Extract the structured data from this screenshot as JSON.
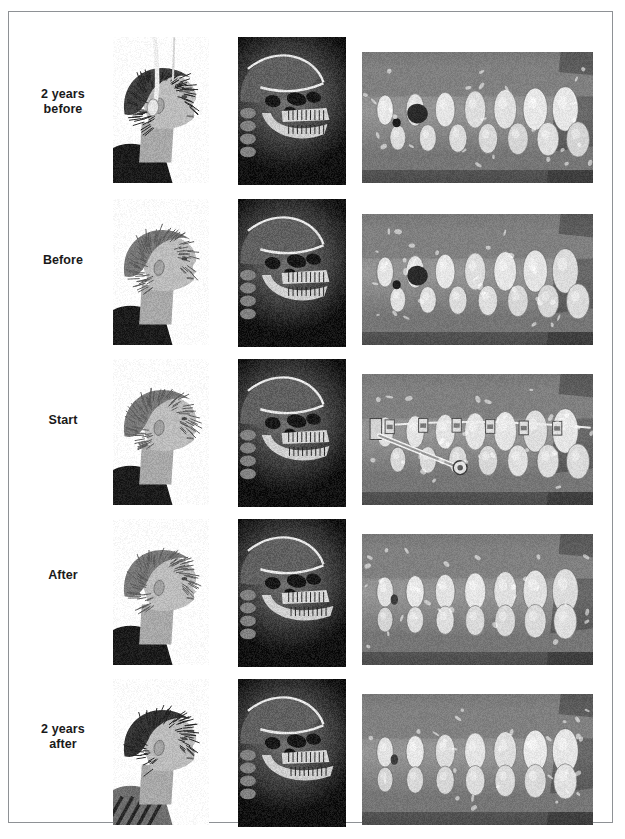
{
  "figure": {
    "caption": "",
    "frame_color": "#8e9195",
    "background_color": "#ffffff",
    "label_color": "#1a1a1a",
    "columns": [
      {
        "key": "profile",
        "name": "facial-profile-photograph",
        "label": ""
      },
      {
        "key": "ceph",
        "name": "lateral-cephalogram-radiograph",
        "label": ""
      },
      {
        "key": "intraoral",
        "name": "intraoral-lateral-photograph",
        "label": ""
      }
    ],
    "rows": [
      {
        "id": "two-years-before",
        "label": "2 years\nbefore",
        "label_line1": "2 years",
        "label_line2": "before",
        "profile_alt": "Boy in profile wearing headgear with head strap",
        "ceph_alt": "Lateral cephalometric radiograph showing retrusive mandible",
        "intraoral_alt": "Right lateral intraoral view, mixed dentition, Class II molar relation"
      },
      {
        "id": "before",
        "label": "Before",
        "label_line1": "Before",
        "label_line2": "",
        "profile_alt": "Boy in profile, convex facial profile, dark shirt",
        "ceph_alt": "Lateral cephalometric radiograph with increased overjet",
        "intraoral_alt": "Right lateral intraoral view showing large overjet"
      },
      {
        "id": "start",
        "label": "Start",
        "label_line1": "Start",
        "label_line2": "",
        "profile_alt": "Boy in profile at start of fixed appliance therapy",
        "ceph_alt": "Lateral cephalometric radiograph at start of treatment",
        "intraoral_alt": "Right lateral intraoral view with fixed braces and Herbst telescopic appliance"
      },
      {
        "id": "after",
        "label": "After",
        "label_line1": "After",
        "label_line2": "",
        "profile_alt": "Boy in profile after treatment, improved chin projection",
        "ceph_alt": "Lateral cephalometric radiograph after treatment",
        "intraoral_alt": "Right lateral intraoral view after appliance removal, corrected overjet"
      },
      {
        "id": "two-years-after",
        "label": "2 years\nafter",
        "label_line1": "2 years",
        "label_line2": "after",
        "profile_alt": "Older boy in profile with curly hair, striped collar",
        "ceph_alt": "Lateral cephalometric radiograph two years post treatment",
        "intraoral_alt": "Right lateral intraoral view two years post treatment, stable Class I occlusion"
      }
    ],
    "geometry": {
      "row_tops": [
        13,
        175,
        335,
        495,
        655
      ],
      "row_heights": [
        162,
        160,
        160,
        160,
        155
      ],
      "label_tops": [
        75,
        241,
        401,
        556,
        710
      ],
      "profile": {
        "left": 104,
        "width": 96,
        "top": 12,
        "height": 146
      },
      "ceph": {
        "left": 229,
        "width": 108,
        "top": 12,
        "height": 148
      },
      "intraoral": {
        "left": 353,
        "width": 231,
        "top": 27,
        "height": 131
      }
    }
  }
}
